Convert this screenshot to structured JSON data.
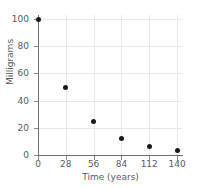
{
  "chart_data": {
    "type": "scatter",
    "title": "",
    "xlabel": "Time (years)",
    "ylabel": "Milligrams",
    "x": [
      0,
      28,
      56,
      84,
      112,
      140
    ],
    "values": [
      100,
      50,
      25,
      12.5,
      6.25,
      3.125
    ],
    "series": [
      {
        "name": "Milligrams remaining",
        "points": [
          {
            "x": 0,
            "y": 100
          },
          {
            "x": 28,
            "y": 50
          },
          {
            "x": 56,
            "y": 25
          },
          {
            "x": 84,
            "y": 12.5
          },
          {
            "x": 112,
            "y": 6.25
          },
          {
            "x": 140,
            "y": 3.125
          }
        ]
      }
    ],
    "xlim": [
      0,
      145
    ],
    "ylim": [
      0,
      103
    ],
    "xticks": [
      0,
      28,
      56,
      84,
      112,
      140
    ],
    "xtick_labels": [
      "0",
      "28",
      "56",
      "84",
      "112",
      "140"
    ],
    "yticks": [
      0,
      20,
      40,
      60,
      80,
      100
    ],
    "ytick_labels": [
      "0",
      "20",
      "40",
      "60",
      "80",
      "100"
    ],
    "grid": true,
    "legend": false,
    "marker": "filled-circle",
    "marker_color": "#1a1a1a",
    "grid_color": "#e8e8e8",
    "axis_color": "#6f6f6f"
  }
}
